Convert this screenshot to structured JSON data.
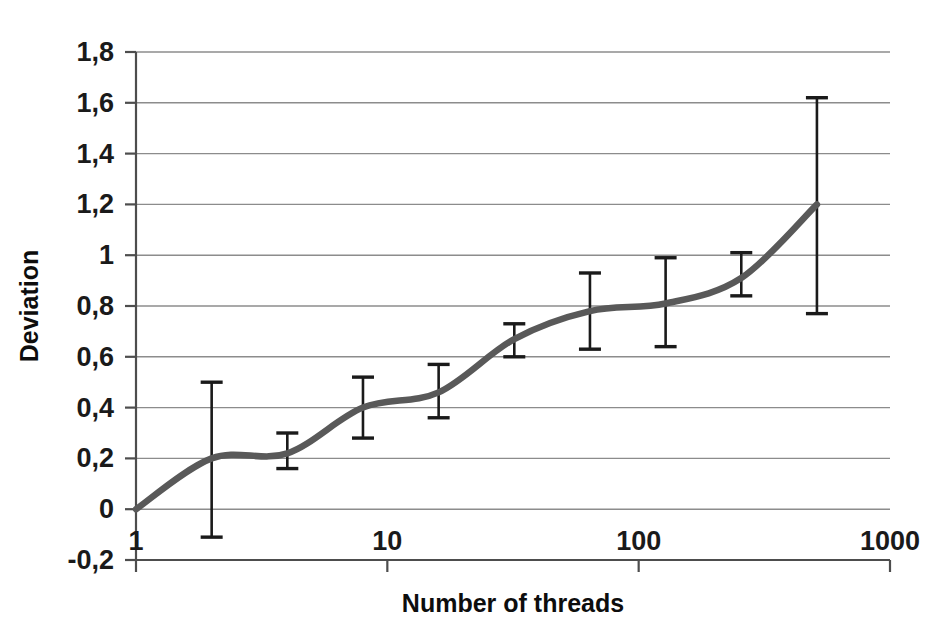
{
  "chart_data": {
    "type": "line",
    "title": "",
    "xlabel": "Number of threads",
    "ylabel": "Deviation",
    "xscale": "log",
    "xlim": [
      1,
      1000
    ],
    "ylim": [
      -0.2,
      1.8
    ],
    "grid": true,
    "legend": "none",
    "x_tick_labels": [
      "1",
      "10",
      "100",
      "1000"
    ],
    "x_tick_values": [
      1,
      10,
      100,
      1000
    ],
    "y_tick_labels": [
      "1,8",
      "1,6",
      "1,4",
      "1,2",
      "1",
      "0,8",
      "0,6",
      "0,4",
      "0,2",
      "0",
      "-0,2"
    ],
    "y_tick_values": [
      1.8,
      1.6,
      1.4,
      1.2,
      1.0,
      0.8,
      0.6,
      0.4,
      0.2,
      0.0,
      -0.2
    ],
    "decimal_separator": ",",
    "x": [
      1,
      2,
      4,
      8,
      16,
      32,
      64,
      128,
      256,
      512
    ],
    "values": [
      0.0,
      0.2,
      0.22,
      0.4,
      0.46,
      0.67,
      0.78,
      0.81,
      0.91,
      1.2
    ],
    "error_bars": [
      {
        "x": 1,
        "y": 0.0,
        "low": 0.0,
        "high": 0.0
      },
      {
        "x": 2,
        "y": 0.2,
        "low": -0.11,
        "high": 0.5
      },
      {
        "x": 4,
        "y": 0.22,
        "low": 0.16,
        "high": 0.3
      },
      {
        "x": 8,
        "y": 0.4,
        "low": 0.28,
        "high": 0.52
      },
      {
        "x": 16,
        "y": 0.46,
        "low": 0.36,
        "high": 0.57
      },
      {
        "x": 32,
        "y": 0.67,
        "low": 0.6,
        "high": 0.73
      },
      {
        "x": 64,
        "y": 0.78,
        "low": 0.63,
        "high": 0.93
      },
      {
        "x": 128,
        "y": 0.81,
        "low": 0.64,
        "high": 0.99
      },
      {
        "x": 256,
        "y": 0.91,
        "low": 0.84,
        "high": 1.01
      },
      {
        "x": 512,
        "y": 1.2,
        "low": 0.77,
        "high": 1.62
      }
    ],
    "series_color": "#595959",
    "errorbar_color": "#1a1a1a",
    "grid_color": "#8c8c8c",
    "axis_color": "#4d4d4d",
    "background": "#ffffff"
  }
}
